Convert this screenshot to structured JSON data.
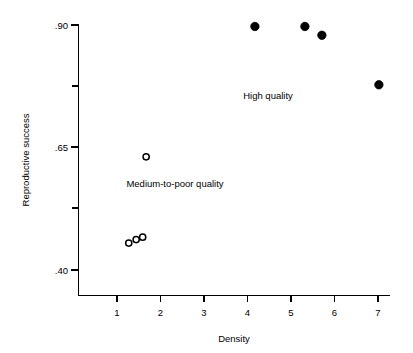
{
  "chart_data": {
    "type": "scatter",
    "title": "",
    "xlabel": "Density",
    "ylabel": "Reproductive success",
    "xlim": [
      0.18,
      7.4
    ],
    "ylim": [
      0.345,
      0.905
    ],
    "grid": false,
    "legend_position": "none",
    "x_ticks": [
      {
        "value": 1,
        "label": "1"
      },
      {
        "value": 2,
        "label": "2"
      },
      {
        "value": 3,
        "label": "3"
      },
      {
        "value": 4,
        "label": "4"
      },
      {
        "value": 5,
        "label": "5"
      },
      {
        "value": 6,
        "label": "6"
      },
      {
        "value": 7,
        "label": "7"
      }
    ],
    "y_ticks": [
      {
        "value": 0.9,
        "label": ".90",
        "major": true
      },
      {
        "value": 0.775,
        "label": "",
        "major": false
      },
      {
        "value": 0.65,
        "label": ".65",
        "major": true
      },
      {
        "value": 0.525,
        "label": "",
        "major": false
      },
      {
        "value": 0.4,
        "label": ".40",
        "major": true
      }
    ],
    "series": [
      {
        "name": "High quality",
        "marker": "filled-circle",
        "color": "#000000",
        "points": [
          {
            "x": 4.17,
            "y": 0.897
          },
          {
            "x": 5.32,
            "y": 0.897
          },
          {
            "x": 5.71,
            "y": 0.879
          },
          {
            "x": 7.02,
            "y": 0.778
          }
        ]
      },
      {
        "name": "Medium-to-poor quality",
        "marker": "open-circle",
        "color": "#000000",
        "points": [
          {
            "x": 1.67,
            "y": 0.631
          },
          {
            "x": 1.27,
            "y": 0.455
          },
          {
            "x": 1.44,
            "y": 0.462
          },
          {
            "x": 1.59,
            "y": 0.467
          }
        ]
      }
    ],
    "annotations": [
      {
        "text": "High quality",
        "x": 4.9,
        "y": 0.745
      },
      {
        "text": "Medium-to-poor quality",
        "x": 2.3,
        "y": 0.596
      }
    ]
  },
  "axis": {
    "y_title": "Reproductive success",
    "x_title": "Density"
  },
  "colors": {
    "background": "#ffffff",
    "ink": "#000000"
  }
}
